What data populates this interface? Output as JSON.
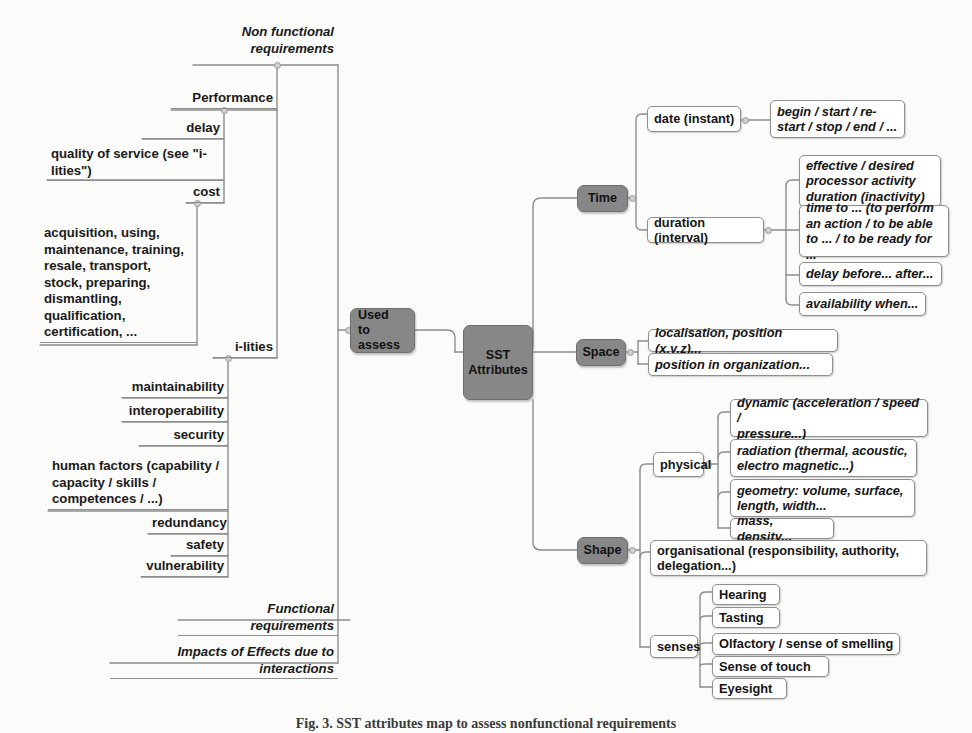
{
  "figure": {
    "caption": "Fig. 3.  SST attributes map to assess nonfunctional requirements",
    "background_color": "#fbfbf9",
    "node_fill_color": "#878787",
    "line_color": "#8d8d8d"
  },
  "diagram": {
    "type": "mind-map",
    "title": "SST Attributes",
    "root_left": "Non functional\nrequirements",
    "center_nodes": [
      {
        "id": "used-to-assess",
        "label": "Used\nto assess"
      },
      {
        "id": "sst-attributes",
        "label": "SST\nAttributes"
      }
    ],
    "left_branch": {
      "label": "Non functional\nrequirements",
      "children": [
        {
          "label": "Performance",
          "children": [
            {
              "label": "delay"
            },
            {
              "label": "quality of service (see \"i-\nlities\")"
            },
            {
              "label": "cost",
              "children": [
                {
                  "label": "acquisition, using,\nmaintenance, training,\nresale, transport,\nstock, preparing,\ndismantling,\nqualification,\ncertification, ..."
                }
              ]
            }
          ]
        },
        {
          "label": "i-lities",
          "children": [
            {
              "label": "maintainability"
            },
            {
              "label": "interoperability"
            },
            {
              "label": "security"
            },
            {
              "label": "human factors (capability /\ncapacity / skills /\ncompetences / ...)"
            },
            {
              "label": "redundancy"
            },
            {
              "label": "safety"
            },
            {
              "label": "vulnerability"
            }
          ]
        },
        {
          "label": "Functional requirements"
        },
        {
          "label": "Impacts of Effects due to interactions"
        }
      ]
    },
    "right_branches": [
      {
        "id": "time",
        "label": "Time",
        "children": [
          {
            "label": "date (instant)",
            "children": [
              {
                "label": "begin / start / re-\nstart / stop / end / ..."
              }
            ]
          },
          {
            "label": "duration (interval)",
            "children": [
              {
                "label": "effective / desired\nprocessor activity\nduration (inactivity)"
              },
              {
                "label": "time to ... (to perform\nan action /  to be able\nto ... / to be ready for ..."
              },
              {
                "label": "delay before... after..."
              },
              {
                "label": "availability when..."
              }
            ]
          }
        ]
      },
      {
        "id": "space",
        "label": "Space",
        "children": [
          {
            "label": "localisation, position (x,y,z)..."
          },
          {
            "label": "position in organization..."
          }
        ]
      },
      {
        "id": "shape",
        "label": "Shape",
        "children": [
          {
            "label": "physical",
            "children": [
              {
                "label": "dynamic (acceleration / speed /\npressure...)"
              },
              {
                "label": "radiation (thermal, acoustic,\nelectro magnetic...)"
              },
              {
                "label": "geometry: volume, surface,\nlength, width..."
              },
              {
                "label": "mass, density..."
              }
            ]
          },
          {
            "label": "organisational (responsibility, authority,\ndelegation...)"
          },
          {
            "label": "senses",
            "children": [
              {
                "label": "Hearing"
              },
              {
                "label": "Tasting"
              },
              {
                "label": "Olfactory / sense of smelling"
              },
              {
                "label": "Sense of touch"
              },
              {
                "label": "Eyesight"
              }
            ]
          }
        ]
      }
    ]
  }
}
